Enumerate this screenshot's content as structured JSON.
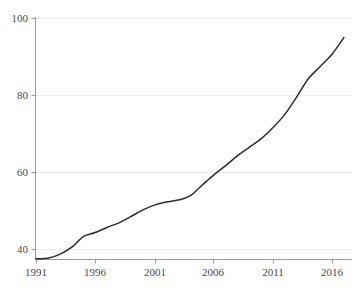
{
  "chart_data": {
    "type": "line",
    "title": "",
    "subtitle": "",
    "xlabel": "",
    "ylabel": "",
    "xlim": [
      1991,
      1917.8
    ],
    "ylim": [
      36.5,
      101
    ],
    "grid": true,
    "grid_axis": "y",
    "legend": null,
    "legend_position": "none",
    "line_color": "#2b2b2b",
    "grid_color": "#ededed",
    "axis_color": "#9a9a9a",
    "background_color": "#ffffff",
    "xticks": [
      1991,
      1996,
      2001,
      2006,
      2011,
      2016
    ],
    "xtick_labels": [
      "1991",
      "1996",
      "2001",
      "2006",
      "2011",
      "2016"
    ],
    "yticks": [
      40,
      60,
      80,
      100
    ],
    "ytick_labels": [
      "40",
      "60",
      "80",
      "100"
    ],
    "series": [
      {
        "name": "series-1",
        "x": [
          1991,
          1992,
          1993,
          1994,
          1995,
          1996,
          1997,
          1998,
          1999,
          2000,
          2001,
          2002,
          2003,
          2004,
          2005,
          2006,
          2007,
          2008,
          2009,
          2010,
          2011,
          2012,
          2013,
          2014,
          2015,
          2016,
          2017
        ],
        "values": [
          37.5,
          37.6,
          38.6,
          40.4,
          43.2,
          44.3,
          45.6,
          46.8,
          48.4,
          50.1,
          51.4,
          52.2,
          52.7,
          53.8,
          56.5,
          59.2,
          61.6,
          64.2,
          66.4,
          68.6,
          71.5,
          74.9,
          79.4,
          84.2,
          87.4,
          90.6,
          94.9
        ]
      }
    ]
  },
  "axes": {
    "x_tick_positions_px": [
      36,
      95,
      155,
      213,
      273,
      332
    ],
    "y_tick_positions_px": [
      249,
      172,
      95,
      18
    ],
    "origin_px": [
      36,
      260
    ],
    "plot_right_px": 352
  }
}
